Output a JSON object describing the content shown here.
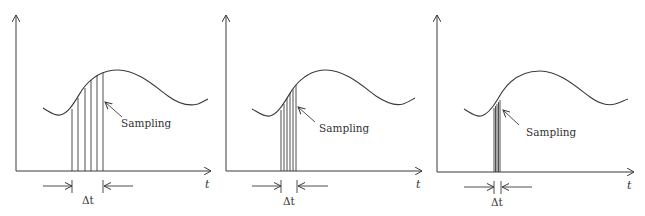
{
  "figure": {
    "colors": {
      "line": "#3a3a3a",
      "text": "#333333",
      "background": "#ffffff"
    },
    "panels": [
      {
        "id": "panel-1",
        "x_axis_label": "t",
        "sampling_label": "Sampling",
        "delta_label": "Δt",
        "sample_lines_x": [
          72,
          78,
          85,
          91,
          97,
          103
        ],
        "delta_bounds": [
          72,
          103
        ]
      },
      {
        "id": "panel-2",
        "x_axis_label": "t",
        "sampling_label": "Sampling",
        "delta_label": "Δt",
        "sample_lines_x": [
          281,
          284,
          287,
          290,
          293,
          296
        ],
        "delta_bounds": [
          281,
          297
        ]
      },
      {
        "id": "panel-3",
        "x_axis_label": "t",
        "sampling_label": "Sampling",
        "delta_label": "Δt",
        "sample_lines_x": [
          494,
          495.5,
          497,
          498.5,
          500
        ],
        "delta_bounds": [
          494,
          501
        ]
      }
    ]
  }
}
